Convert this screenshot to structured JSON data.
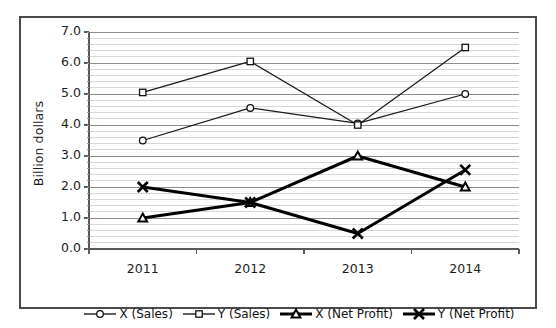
{
  "chart_data": {
    "type": "line",
    "title": "",
    "xlabel": "",
    "ylabel": "Billion dollars",
    "categories": [
      "2011",
      "2012",
      "2013",
      "2014"
    ],
    "ylim": [
      0.0,
      7.0
    ],
    "ytick_labels": [
      "0.0",
      "1.0",
      "2.0",
      "3.0",
      "4.0",
      "5.0",
      "6.0",
      "7.0"
    ],
    "ytick_values": [
      0.0,
      1.0,
      2.0,
      3.0,
      4.0,
      5.0,
      6.0,
      7.0
    ],
    "grid": {
      "major_horizontal": true,
      "minor_horizontal": true,
      "minor_step": 0.2,
      "vertical": false
    },
    "legend_position": "bottom",
    "series": [
      {
        "name": "X (Sales)",
        "marker": "circle-open",
        "line_weight": "thin",
        "color": "#1a1a1a",
        "values": [
          3.5,
          4.55,
          4.05,
          5.0
        ]
      },
      {
        "name": "Y (Sales)",
        "marker": "square-open",
        "line_weight": "thin",
        "color": "#1a1a1a",
        "values": [
          5.05,
          6.05,
          4.0,
          6.5
        ]
      },
      {
        "name": "X (Net Profit)",
        "marker": "triangle-open",
        "line_weight": "thick",
        "color": "#000000",
        "values": [
          1.0,
          1.5,
          3.0,
          2.0
        ]
      },
      {
        "name": "Y (Net Profit)",
        "marker": "x-cross",
        "line_weight": "thick",
        "color": "#000000",
        "values": [
          2.0,
          1.5,
          0.5,
          2.55
        ]
      }
    ]
  },
  "legend": {
    "items": [
      {
        "label": "X (Sales)",
        "marker": "circle-open"
      },
      {
        "label": "Y (Sales)",
        "marker": "square-open"
      },
      {
        "label": "X (Net Profit)",
        "marker": "triangle-open"
      },
      {
        "label": "Y (Net Profit)",
        "marker": "x-cross"
      }
    ]
  },
  "colors": {
    "frame": "#4a4a4a",
    "axis": "#595959",
    "grid_major": "#8c8c8c",
    "grid_minor": "#d6d6d6",
    "text": "#1c1c1c",
    "series_thin": "#1a1a1a",
    "series_thick": "#000000"
  }
}
